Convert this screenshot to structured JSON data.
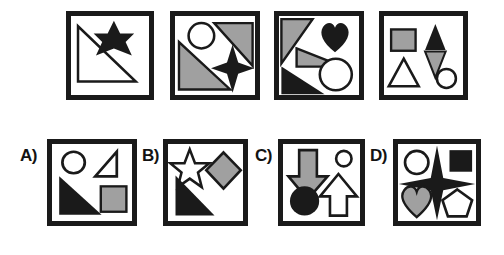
{
  "puzzle": {
    "type": "visual-analogy-shape-matrix",
    "colors": {
      "black": "#1a1a1a",
      "gray": "#a0a0a0",
      "white": "#ffffff",
      "frame": "#1a1a1a",
      "background": "#ffffff"
    },
    "prompt_row": {
      "name": "prompt-sequence",
      "panels": [
        {
          "id": "prompt-1",
          "index": 1,
          "frame": {
            "x": 66,
            "y": 11,
            "w": 88,
            "h": 89
          },
          "shapes": [
            {
              "name": "right-triangle-outline",
              "fill": "white",
              "stroke": "black"
            },
            {
              "name": "six-pointed-star",
              "fill": "black",
              "stroke": "none"
            }
          ],
          "shape_count": 2
        },
        {
          "id": "prompt-2",
          "index": 2,
          "frame": {
            "x": 170,
            "y": 11,
            "w": 90,
            "h": 89
          },
          "shapes": [
            {
              "name": "right-triangle-upper",
              "fill": "gray",
              "stroke": "black"
            },
            {
              "name": "circle-outline",
              "fill": "white",
              "stroke": "black"
            },
            {
              "name": "right-triangle-lower",
              "fill": "gray",
              "stroke": "black"
            },
            {
              "name": "four-pointed-star",
              "fill": "black",
              "stroke": "none"
            }
          ],
          "shape_count": 4
        },
        {
          "id": "prompt-3",
          "index": 3,
          "frame": {
            "x": 274,
            "y": 11,
            "w": 90,
            "h": 89
          },
          "shapes": [
            {
              "name": "triangle-upper-left",
              "fill": "gray",
              "stroke": "black"
            },
            {
              "name": "heart",
              "fill": "black",
              "stroke": "none"
            },
            {
              "name": "thin-triangle-middle",
              "fill": "gray",
              "stroke": "black"
            },
            {
              "name": "triangle-lower-left",
              "fill": "black",
              "stroke": "none"
            },
            {
              "name": "circle-outline",
              "fill": "white",
              "stroke": "black"
            }
          ],
          "shape_count": 5
        },
        {
          "id": "prompt-4",
          "index": 4,
          "frame": {
            "x": 379,
            "y": 11,
            "w": 89,
            "h": 89
          },
          "shapes": [
            {
              "name": "square",
              "fill": "gray",
              "stroke": "black"
            },
            {
              "name": "triangle-up",
              "fill": "black",
              "stroke": "none"
            },
            {
              "name": "triangle-down",
              "fill": "gray",
              "stroke": "black"
            },
            {
              "name": "triangle-outline",
              "fill": "white",
              "stroke": "black"
            },
            {
              "name": "circle-outline",
              "fill": "white",
              "stroke": "black"
            }
          ],
          "shape_count": 5
        }
      ]
    },
    "answer_row": {
      "name": "answer-options",
      "options": [
        {
          "id": "option-a",
          "label": "A)",
          "label_pos": {
            "x": 20,
            "y": 147
          },
          "frame": {
            "x": 47,
            "y": 139,
            "w": 90,
            "h": 87
          },
          "shapes": [
            {
              "name": "circle-outline",
              "fill": "white",
              "stroke": "black"
            },
            {
              "name": "right-triangle-outline",
              "fill": "white",
              "stroke": "black"
            },
            {
              "name": "right-triangle-filled",
              "fill": "black",
              "stroke": "none"
            },
            {
              "name": "square",
              "fill": "gray",
              "stroke": "black"
            }
          ],
          "shape_count": 4
        },
        {
          "id": "option-b",
          "label": "B)",
          "label_pos": {
            "x": 142,
            "y": 147
          },
          "frame": {
            "x": 163,
            "y": 139,
            "w": 85,
            "h": 87
          },
          "shapes": [
            {
              "name": "five-pointed-star-outline",
              "fill": "white",
              "stroke": "black"
            },
            {
              "name": "diamond",
              "fill": "gray",
              "stroke": "black"
            },
            {
              "name": "right-triangle-filled",
              "fill": "black",
              "stroke": "none"
            }
          ],
          "shape_count": 3
        },
        {
          "id": "option-c",
          "label": "C)",
          "label_pos": {
            "x": 255,
            "y": 147
          },
          "frame": {
            "x": 278,
            "y": 139,
            "w": 87,
            "h": 87
          },
          "shapes": [
            {
              "name": "arrow-down",
              "fill": "gray",
              "stroke": "black"
            },
            {
              "name": "small-circle-outline",
              "fill": "white",
              "stroke": "black"
            },
            {
              "name": "circle-filled",
              "fill": "black",
              "stroke": "none"
            },
            {
              "name": "arrow-up-outline",
              "fill": "white",
              "stroke": "black"
            }
          ],
          "shape_count": 4
        },
        {
          "id": "option-d",
          "label": "D)",
          "label_pos": {
            "x": 370,
            "y": 147
          },
          "frame": {
            "x": 393,
            "y": 139,
            "w": 88,
            "h": 87
          },
          "shapes": [
            {
              "name": "circle-outline",
              "fill": "white",
              "stroke": "black"
            },
            {
              "name": "square",
              "fill": "black",
              "stroke": "none"
            },
            {
              "name": "four-pointed-star-large",
              "fill": "black",
              "stroke": "none"
            },
            {
              "name": "heart",
              "fill": "gray",
              "stroke": "black"
            },
            {
              "name": "pentagon-outline",
              "fill": "white",
              "stroke": "black"
            }
          ],
          "shape_count": 5
        }
      ]
    }
  }
}
